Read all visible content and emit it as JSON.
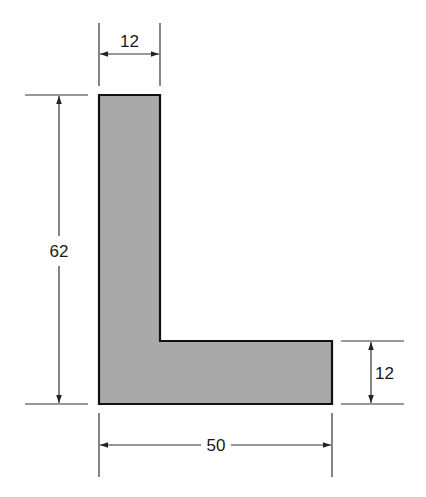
{
  "diagram": {
    "type": "L-shaped cross-section",
    "colors": {
      "fill": "#a9a9a9",
      "outline": "#111111",
      "dimension_lines": "#333333",
      "text": "#1a1a1a"
    },
    "dimensions": {
      "top_width": {
        "label": "12",
        "description": "vertical leg thickness"
      },
      "total_height": {
        "label": "62",
        "description": "overall height"
      },
      "bottom_thickness": {
        "label": "12",
        "description": "horizontal leg thickness"
      },
      "total_width": {
        "label": "50",
        "description": "overall width"
      }
    }
  }
}
